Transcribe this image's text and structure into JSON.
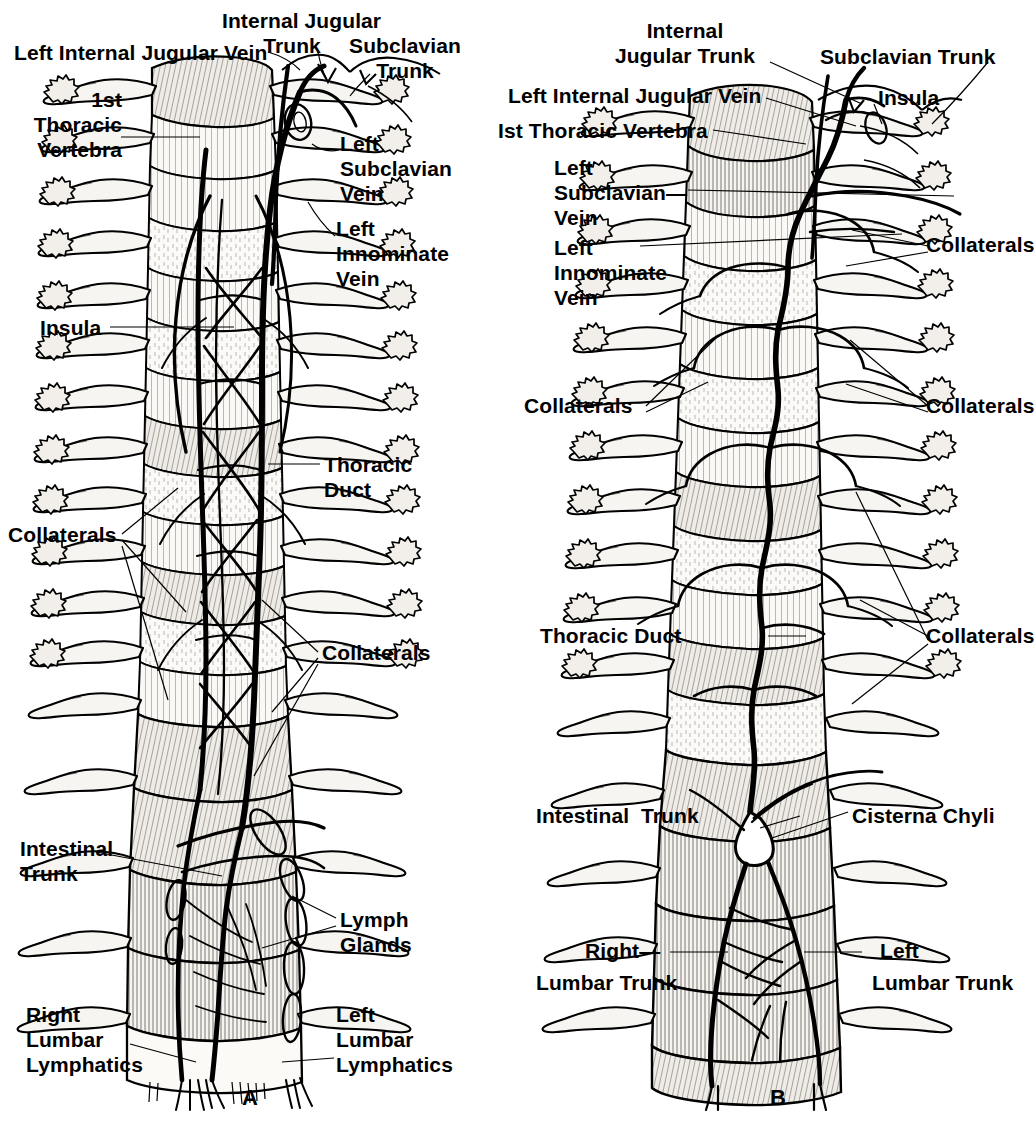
{
  "figure": {
    "type": "anatomical-line-drawing",
    "panels": [
      {
        "id": "A",
        "letter": "A",
        "labels": [
          {
            "key": "left_internal_jugular_vein",
            "text": "Left Internal Jugular Vein"
          },
          {
            "key": "internal_jugular_trunk",
            "text": "Internal Jugular\nTrunk"
          },
          {
            "key": "subclavian_trunk",
            "text": "Subclavian\nTrunk"
          },
          {
            "key": "first_thoracic_vertebra",
            "text": "1st\nThoracic\nVertebra"
          },
          {
            "key": "left_subclavian_vein",
            "text": "Left\nSubclavian\nVein"
          },
          {
            "key": "left_innominate_vein",
            "text": "Left\nInnominate\nVein"
          },
          {
            "key": "insula",
            "text": "Insula"
          },
          {
            "key": "thoracic_duct",
            "text": "Thoracic\nDuct"
          },
          {
            "key": "collaterals_left",
            "text": "Collaterals"
          },
          {
            "key": "collaterals_right",
            "text": "Collaterals"
          },
          {
            "key": "intestinal_trunk",
            "text": "Intestinal\nTrunk"
          },
          {
            "key": "lymph_glands",
            "text": "Lymph\nGlands"
          },
          {
            "key": "right_lumbar_lymphatics",
            "text": "Right\nLumbar\nLymphatics"
          },
          {
            "key": "left_lumbar_lymphatics",
            "text": "Left\nLumbar\nLymphatics"
          }
        ]
      },
      {
        "id": "B",
        "letter": "B",
        "labels": [
          {
            "key": "internal_jugular_trunk",
            "text": "Internal\nJugular Trunk"
          },
          {
            "key": "subclavian_trunk",
            "text": "Subclavian Trunk"
          },
          {
            "key": "left_internal_jugular_vein",
            "text": "Left Internal Jugular Vein"
          },
          {
            "key": "insula",
            "text": "Insula"
          },
          {
            "key": "first_thoracic_vertebra",
            "text": "Ist Thoracic Vertebra"
          },
          {
            "key": "left_subclavian_vein",
            "text": "Left\nSubclavian—\nVein"
          },
          {
            "key": "left_innominate_vein",
            "text": "Left\nInnominate\nVein"
          },
          {
            "key": "collaterals_upper_right",
            "text": "Collaterals"
          },
          {
            "key": "collaterals_mid_left",
            "text": "Collaterals"
          },
          {
            "key": "collaterals_mid_right",
            "text": "Collaterals"
          },
          {
            "key": "thoracic_duct",
            "text": "Thoracic Duct"
          },
          {
            "key": "collaterals_lower_right",
            "text": "Collaterals"
          },
          {
            "key": "intestinal_trunk",
            "text": "Intestinal  Trunk"
          },
          {
            "key": "cisterna_chyli",
            "text": "Cisterna Chyli"
          },
          {
            "key": "right_lumbar_trunk",
            "text": "Right—"
          },
          {
            "key": "right_lumbar_trunk_2",
            "text": "Lumbar Trunk"
          },
          {
            "key": "left_lumbar_trunk",
            "text": "Left"
          },
          {
            "key": "left_lumbar_trunk_2",
            "text": "Lumbar Trunk"
          }
        ]
      }
    ]
  },
  "colors": {
    "ink": "#000000",
    "paper": "#ffffff",
    "bone_fill": "#f4f2ee",
    "shade": "#8c8880",
    "light_shade": "#c9c5bd"
  }
}
